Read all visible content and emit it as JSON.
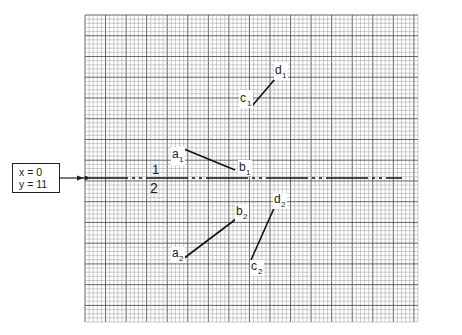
{
  "start_condition": {
    "line1": "x = 0",
    "line2": "y = 11"
  },
  "grid": {
    "columns": 81,
    "rows": 74,
    "major_every": 5,
    "minor_color": "#9a9a9a",
    "major_color": "#555555"
  },
  "reference_line": {
    "style": "chain (long dash, short dash, short dash)",
    "region_labels": {
      "above": "1",
      "below": "2"
    }
  },
  "segments": [
    {
      "name": "c1-d1",
      "start": {
        "label": "c",
        "sub": "1"
      },
      "end": {
        "label": "d",
        "sub": "1"
      }
    },
    {
      "name": "a1-b1",
      "start": {
        "label": "a",
        "sub": "1"
      },
      "end": {
        "label": "b",
        "sub": "1"
      }
    },
    {
      "name": "a2-b2",
      "start": {
        "label": "a",
        "sub": "2"
      },
      "end": {
        "label": "b",
        "sub": "2"
      }
    },
    {
      "name": "c2-d2",
      "start": {
        "label": "c",
        "sub": "2"
      },
      "end": {
        "label": "d",
        "sub": "2"
      }
    }
  ]
}
